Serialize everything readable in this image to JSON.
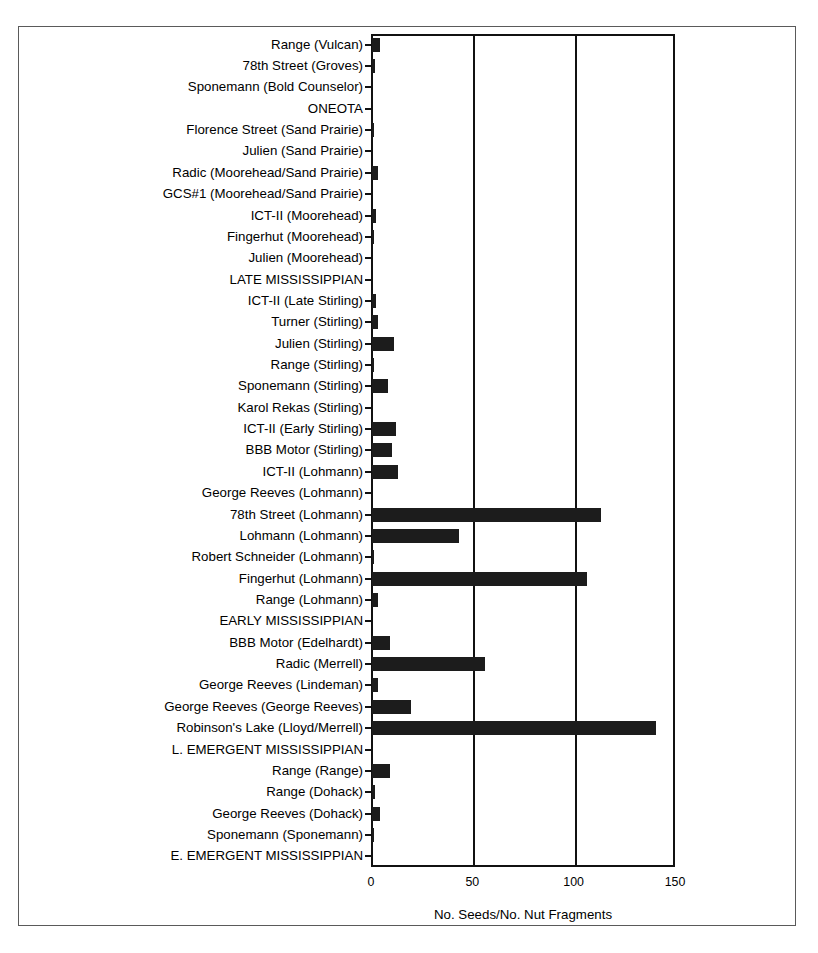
{
  "chart_data": {
    "type": "bar",
    "orientation": "horizontal",
    "title": "",
    "xlabel": "No. Seeds/No. Nut Fragments",
    "ylabel": "",
    "xlim": [
      0,
      150
    ],
    "xticks": [
      0,
      50,
      100,
      150
    ],
    "xtick_labels": [
      "0",
      "50",
      "100",
      "150"
    ],
    "grid": true,
    "grid_axis": "x",
    "legend": false,
    "bar_color": "#1c1c1c",
    "categories": [
      "Range (Vulcan)",
      "78th Street (Groves)",
      "Sponemann (Bold Counselor)",
      "ONEOTA",
      "Florence Street (Sand Prairie)",
      "Julien (Sand Prairie)",
      "Radic (Moorehead/Sand Prairie)",
      "GCS#1 (Moorehead/Sand Prairie)",
      "ICT-II (Moorehead)",
      "Fingerhut (Moorehead)",
      "Julien (Moorehead)",
      "LATE MISSISSIPPIAN",
      "ICT-II (Late Stirling)",
      "Turner (Stirling)",
      "Julien (Stirling)",
      "Range (Stirling)",
      "Sponemann (Stirling)",
      "Karol Rekas (Stirling)",
      "ICT-II (Early Stirling)",
      "BBB Motor (Stirling)",
      "ICT-II (Lohmann)",
      "George Reeves (Lohmann)",
      "78th Street (Lohmann)",
      "Lohmann (Lohmann)",
      "Robert Schneider (Lohmann)",
      "Fingerhut (Lohmann)",
      "Range (Lohmann)",
      "EARLY MISSISSIPPIAN",
      "BBB Motor (Edelhardt)",
      "Radic (Merrell)",
      "George Reeves (Lindeman)",
      "George Reeves (George Reeves)",
      "Robinson's Lake (Lloyd/Merrell)",
      "L. EMERGENT MISSISSIPPIAN",
      "Range (Range)",
      "Range (Dohack)",
      "George Reeves (Dohack)",
      "Sponemann (Sponemann)",
      "E. EMERGENT MISSISSIPPIAN"
    ],
    "values": [
      4,
      1.5,
      0,
      0,
      1,
      0,
      3,
      0,
      2,
      1,
      0,
      0,
      2,
      3,
      11,
      0.5,
      8,
      0,
      12,
      10,
      13,
      0,
      113,
      43,
      1,
      106,
      3,
      0,
      9,
      56,
      3,
      19,
      140,
      0,
      9,
      1.5,
      4,
      0.5,
      0
    ],
    "period_headers": [
      "LATE MISSISSIPPIAN",
      "EARLY MISSISSIPPIAN",
      "L. EMERGENT MISSISSIPPIAN",
      "E. EMERGENT MISSISSIPPIAN"
    ]
  }
}
